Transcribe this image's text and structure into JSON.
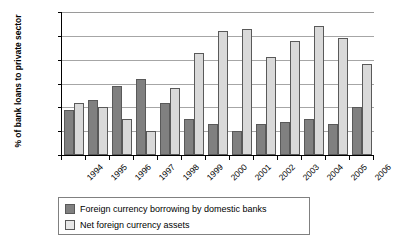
{
  "chart_data": {
    "type": "bar",
    "title": "",
    "xlabel": "",
    "ylabel": "% of bank loans to private sector",
    "ylim": [
      0,
      30
    ],
    "ytick_labels": [
      "0%",
      "5%",
      "10%",
      "15%",
      "20%",
      "25%",
      "30%"
    ],
    "ytick_values": [
      0,
      5,
      10,
      15,
      20,
      25,
      30
    ],
    "grid": true,
    "legend_position": "bottom",
    "categories": [
      "1994",
      "1995",
      "1996",
      "1997",
      "1998",
      "1999",
      "2000",
      "2001",
      "2002",
      "2003",
      "2004",
      "2005",
      "2006"
    ],
    "series": [
      {
        "name": "Foreign currency borrowing by domestic banks",
        "color": "#808080",
        "values": [
          9.5,
          11.5,
          14.5,
          16.0,
          11.0,
          7.5,
          6.5,
          5.0,
          6.5,
          7.0,
          7.5,
          6.5,
          10.0
        ]
      },
      {
        "name": "Net foreign currency assets",
        "color": "#d9d9d9",
        "values": [
          11.0,
          10.0,
          7.5,
          5.0,
          14.0,
          21.5,
          26.0,
          26.5,
          20.5,
          24.0,
          27.0,
          24.5,
          19.0
        ]
      }
    ]
  },
  "legend": {
    "items": [
      {
        "label": "Foreign currency borrowing by domestic banks",
        "swatch": "dark"
      },
      {
        "label": "Net foreign currency assets",
        "swatch": "light"
      }
    ]
  }
}
